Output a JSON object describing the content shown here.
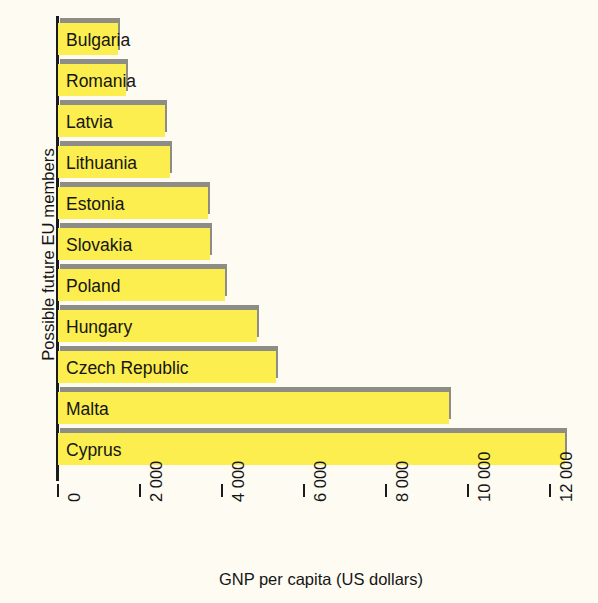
{
  "chart_data": {
    "type": "bar",
    "orientation": "horizontal",
    "title": "",
    "xlabel": "GNP per capita (US dollars)",
    "ylabel": "Possible future EU members",
    "xlim": [
      0,
      13100
    ],
    "grid": false,
    "legend": null,
    "xticks": [
      0,
      2000,
      4000,
      6000,
      8000,
      10000,
      12000
    ],
    "xtick_labels": [
      "0",
      "2 000",
      "4 000",
      "6 000",
      "8 000",
      "10 000",
      "12 000"
    ],
    "categories": [
      "Bulgaria",
      "Romania",
      "Latvia",
      "Lithuania",
      "Estonia",
      "Slovakia",
      "Poland",
      "Hungary",
      "Czech Republic",
      "Malta",
      "Cyprus"
    ],
    "values": [
      1470,
      1660,
      2610,
      2730,
      3660,
      3710,
      4070,
      4850,
      5320,
      9540,
      12370
    ],
    "bar_color": "#fbee4e",
    "shadow_color": "#8d8d85",
    "background_color": "#fdfbf2",
    "axis_color": "#1b1b1b"
  }
}
